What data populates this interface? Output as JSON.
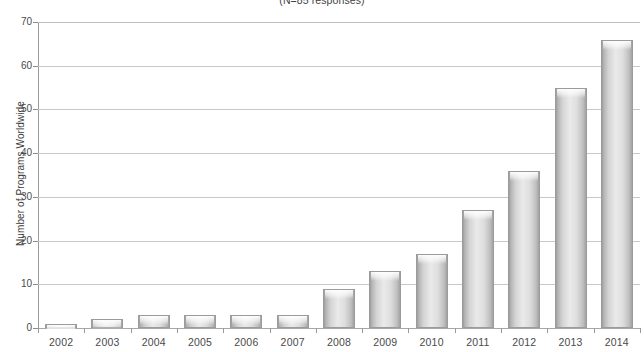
{
  "chart_data": {
    "type": "bar",
    "title": "",
    "subtitle": "(N=85 responses)",
    "xlabel": "",
    "ylabel": "Number of Programs Worldwide",
    "categories": [
      "2002",
      "2003",
      "2004",
      "2005",
      "2006",
      "2007",
      "2008",
      "2009",
      "2010",
      "2011",
      "2012",
      "2013",
      "2014"
    ],
    "values": [
      1,
      2,
      3,
      3,
      3,
      3,
      9,
      13,
      17,
      27,
      36,
      55,
      66
    ],
    "ylim": [
      0,
      70
    ],
    "yticks": [
      0,
      10,
      20,
      30,
      40,
      50,
      60,
      70
    ],
    "ytick_labels": [
      "0",
      "10",
      "20",
      "30",
      "40",
      "50",
      "60",
      "70"
    ],
    "grid": true,
    "legend": false,
    "legend_position": "none",
    "series": [
      {
        "name": "Number of Programs Worldwide",
        "values": [
          1,
          2,
          3,
          3,
          3,
          3,
          9,
          13,
          17,
          27,
          36,
          55,
          66
        ]
      }
    ],
    "colors": {
      "bar_fill_light": "#eaeaea",
      "bar_fill_mid": "#c9c9c9",
      "bar_edge": "#9b9b9b",
      "gridline": "#c8c8c8",
      "axis": "#9a9a9a",
      "text": "#444444"
    }
  }
}
